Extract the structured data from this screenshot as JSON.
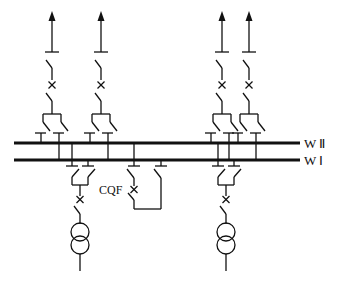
{
  "diagram": {
    "type": "double-bus single-breaker substation single-line diagram",
    "buses": [
      {
        "id": "bus-II",
        "label": "W Ⅱ",
        "y": 143
      },
      {
        "id": "bus-I",
        "label": "W Ⅰ",
        "y": 160
      }
    ],
    "outgoing_feeders": [
      {
        "id": "feeder-1",
        "x": 52
      },
      {
        "id": "feeder-2",
        "x": 101
      },
      {
        "id": "feeder-3",
        "x": 222
      },
      {
        "id": "feeder-4",
        "x": 249
      }
    ],
    "transformer_bays": [
      {
        "id": "transformer-1",
        "x": 80
      },
      {
        "id": "transformer-2",
        "x": 226
      }
    ],
    "bus_coupler": {
      "label": "CQF"
    },
    "colors": {
      "line": "#111111",
      "background": "#ffffff"
    }
  }
}
